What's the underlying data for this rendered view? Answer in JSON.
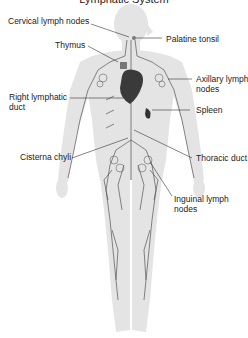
{
  "title": "Lymphatic System",
  "labels": {
    "cervical": "Cervical lymph nodes",
    "palatine": "Palatine tonsil",
    "thymus": "Thymus",
    "axillary_1": "Axillary lymph",
    "axillary_2": "nodes",
    "right_duct_1": "Right lymphatic",
    "right_duct_2": "duct",
    "spleen": "Spleen",
    "cisterna": "Cisterna chyli",
    "thoracic": "Thoracic duct",
    "inguinal_1": "Inguinal lymph",
    "inguinal_2": "nodes"
  },
  "colors": {
    "body": "#e3e3e3",
    "vessel": "#555555",
    "organ": "#3a3a3a",
    "leader": "#333333"
  }
}
